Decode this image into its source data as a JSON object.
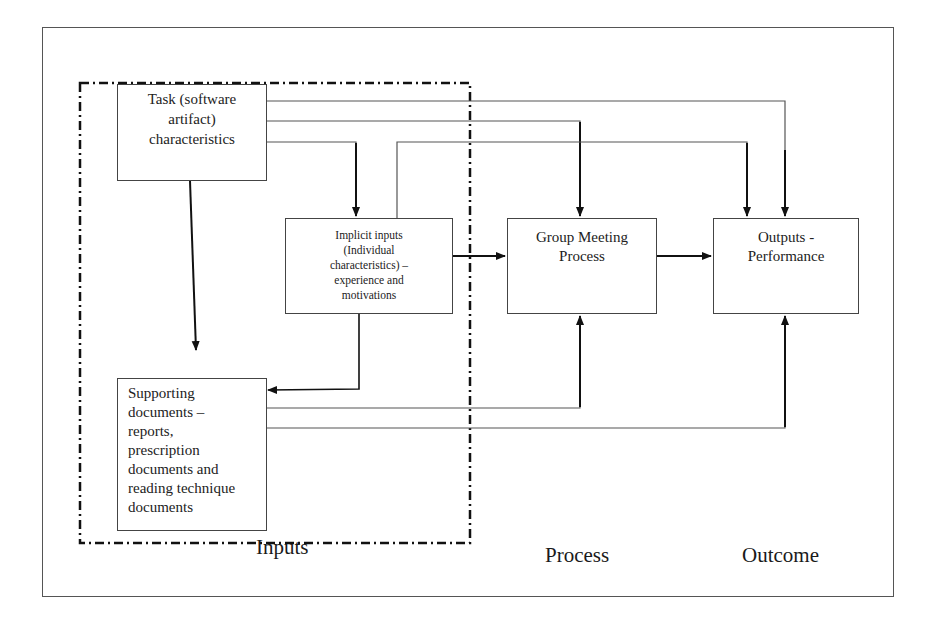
{
  "diagram": {
    "boxes": {
      "task": "Task (software\nartifact)\ncharacteristics",
      "implicit": "Implicit inputs\n(Individual\ncharacteristics) –\nexperience and\nmotivations",
      "group": "Group Meeting\nProcess",
      "outputs": "Outputs -\nPerformance",
      "support": "Supporting\ndocuments –\nreports,\nprescription\ndocuments and\nreading technique\ndocuments"
    },
    "sections": {
      "inputs": "Inputs",
      "process": "Process",
      "outcome": "Outcome"
    },
    "colors": {
      "line": "#222222",
      "thin_line": "#555555",
      "frame": "#555555",
      "background": "#ffffff"
    }
  }
}
